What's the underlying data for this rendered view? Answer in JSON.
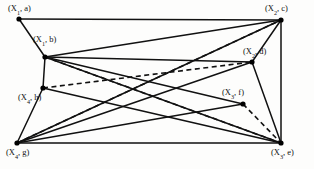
{
  "figure": {
    "type": "graph-diagram",
    "background": "#fdfdfc",
    "edge_color": "#111111",
    "vertex_color": "#000000",
    "width": 314,
    "height": 169
  },
  "vertices": [
    {
      "id": "a",
      "group": "X",
      "index": "1",
      "label": "(X1, a)",
      "label_text": "(X",
      "sub": "1",
      "tail": ", a)",
      "x": 19,
      "y": 19,
      "label_x": 8,
      "label_y": 4
    },
    {
      "id": "b",
      "group": "X",
      "index": "1",
      "label": "(X1, b)",
      "label_text": "(X",
      "sub": "1",
      "tail": ", b)",
      "x": 45,
      "y": 57,
      "label_x": 33,
      "label_y": 35
    },
    {
      "id": "c",
      "group": "X",
      "index": "2",
      "label": "(X2, c)",
      "label_text": "(X",
      "sub": "2",
      "tail": ", c)",
      "x": 281,
      "y": 20,
      "label_x": 265,
      "label_y": 4
    },
    {
      "id": "d",
      "group": "X",
      "index": "2",
      "label": "(X2, d)",
      "label_text": "(X",
      "sub": "2",
      "tail": ", d)",
      "x": 252,
      "y": 62,
      "label_x": 243,
      "label_y": 47
    },
    {
      "id": "e",
      "group": "X",
      "index": "3",
      "label": "(X3, e)",
      "label_text": "(X",
      "sub": "3",
      "tail": ", e)",
      "x": 281,
      "y": 143,
      "label_x": 271,
      "label_y": 148
    },
    {
      "id": "f",
      "group": "X",
      "index": "3",
      "label": "(X3, f)",
      "label_text": "(X",
      "sub": "3",
      "tail": ", f)",
      "x": 243,
      "y": 104,
      "label_x": 222,
      "label_y": 88
    },
    {
      "id": "g",
      "group": "X",
      "index": "4",
      "label": "(X4, g)",
      "label_text": "(X",
      "sub": "4",
      "tail": ", g)",
      "x": 17,
      "y": 143,
      "label_x": 6,
      "label_y": 148
    },
    {
      "id": "h",
      "group": "X",
      "index": "4",
      "label": "(X4, h)",
      "label_text": "(X",
      "sub": "4",
      "tail": ", h)",
      "x": 43,
      "y": 88,
      "label_x": 18,
      "label_y": 93
    }
  ],
  "edges_solid": [
    {
      "from": "a",
      "to": "c"
    },
    {
      "from": "a",
      "to": "b"
    },
    {
      "from": "b",
      "to": "h"
    },
    {
      "from": "b",
      "to": "c"
    },
    {
      "from": "b",
      "to": "d"
    },
    {
      "from": "b",
      "to": "e"
    },
    {
      "from": "b",
      "to": "f"
    },
    {
      "from": "h",
      "to": "g"
    },
    {
      "from": "h",
      "to": "e"
    },
    {
      "from": "g",
      "to": "c"
    },
    {
      "from": "g",
      "to": "d"
    },
    {
      "from": "g",
      "to": "f"
    },
    {
      "from": "g",
      "to": "e"
    },
    {
      "from": "c",
      "to": "e"
    },
    {
      "from": "c",
      "to": "d"
    },
    {
      "from": "d",
      "to": "e"
    }
  ],
  "edges_dashed": [
    {
      "from": "g",
      "to": "c"
    },
    {
      "from": "h",
      "to": "d"
    },
    {
      "from": "f",
      "to": "e"
    },
    {
      "from": "b",
      "to": "e"
    }
  ]
}
